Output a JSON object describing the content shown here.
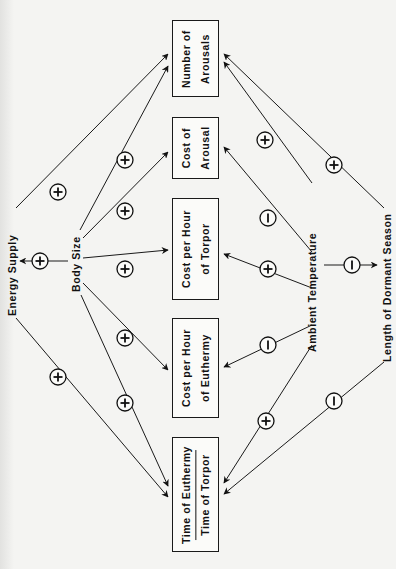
{
  "diagram": {
    "orientation": "rotated-90-ccw",
    "sources": {
      "body_size": "Body Size",
      "ambient_temperature": "Ambient Temperature",
      "energy_supply": "Energy Supply",
      "length_of_dormant_season": "Length of Dormant Season"
    },
    "boxes": [
      {
        "id": "number_of_arousals",
        "line1": "Number of",
        "line2": "Arousals"
      },
      {
        "id": "cost_of_arousal",
        "line1": "Cost of",
        "line2": "Arousal"
      },
      {
        "id": "cost_per_hour_torpor",
        "line1": "Cost per Hour",
        "line2": "of Torpor"
      },
      {
        "id": "cost_per_hour_euthermy",
        "line1": "Cost per Hour",
        "line2": "of Euthermy"
      },
      {
        "id": "time_ratio",
        "numerator": "Time of Euthermy",
        "denominator": "Time of Torpor"
      }
    ],
    "edges": [
      {
        "from": "Energy Supply",
        "to": "Number of Arousals",
        "sign": "+"
      },
      {
        "from": "Body Size",
        "to": "Number of Arousals",
        "sign": "+"
      },
      {
        "from": "Body Size",
        "to": "Cost of Arousal",
        "sign": "+"
      },
      {
        "from": "Body Size",
        "to": "Cost per Hour of Torpor",
        "sign": "+"
      },
      {
        "from": "Body Size",
        "to": "Energy Supply",
        "sign": "+"
      },
      {
        "from": "Body Size",
        "to": "Cost per Hour of Euthermy",
        "sign": "+"
      },
      {
        "from": "Body Size",
        "to": "Time of Euthermy / Time of Torpor",
        "sign": "+"
      },
      {
        "from": "Energy Supply",
        "to": "Time of Euthermy / Time of Torpor",
        "sign": "+"
      },
      {
        "from": "Ambient Temperature",
        "to": "Number of Arousals",
        "sign": "+"
      },
      {
        "from": "Ambient Temperature",
        "to": "Cost of Arousal",
        "sign": "−"
      },
      {
        "from": "Ambient Temperature",
        "to": "Cost per Hour of Torpor",
        "sign": "+"
      },
      {
        "from": "Ambient Temperature",
        "to": "Cost per Hour of Euthermy",
        "sign": "−"
      },
      {
        "from": "Ambient Temperature",
        "to": "Time of Euthermy / Time of Torpor",
        "sign": "+"
      },
      {
        "from": "Ambient Temperature",
        "to": "Length of Dormant Season",
        "sign": "−"
      },
      {
        "from": "Length of Dormant Season",
        "to": "Number of Arousals",
        "sign": "+"
      },
      {
        "from": "Length of Dormant Season",
        "to": "Time of Euthermy / Time of Torpor",
        "sign": "−"
      }
    ],
    "colors": {
      "ink": "#1a1a1a",
      "paper": "#f4f4f2"
    }
  }
}
